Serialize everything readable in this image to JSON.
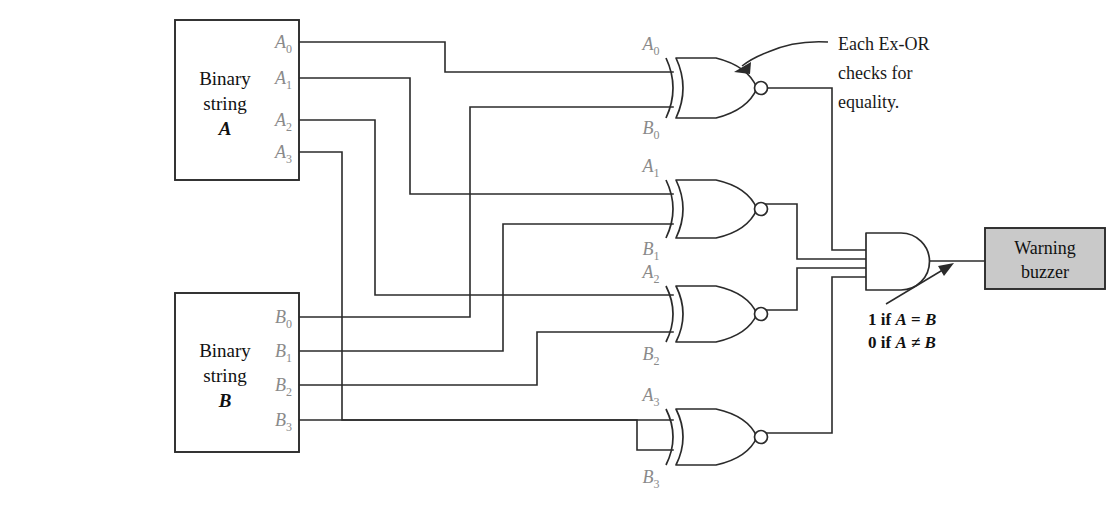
{
  "diagram": {
    "colors": {
      "wire": "#2b2b2b",
      "pin_label": "#8a8a8a",
      "buzzer_fill": "#c9c9c9",
      "text": "#1a1a1a",
      "background": "#ffffff"
    },
    "blocks": {
      "string_a": {
        "line1": "Binary",
        "line2": "string",
        "line3": "A",
        "pins": [
          {
            "base": "A",
            "sub": "0"
          },
          {
            "base": "A",
            "sub": "1"
          },
          {
            "base": "A",
            "sub": "2"
          },
          {
            "base": "A",
            "sub": "3"
          }
        ]
      },
      "string_b": {
        "line1": "Binary",
        "line2": "string",
        "line3": "B",
        "pins": [
          {
            "base": "B",
            "sub": "0"
          },
          {
            "base": "B",
            "sub": "1"
          },
          {
            "base": "B",
            "sub": "2"
          },
          {
            "base": "B",
            "sub": "3"
          }
        ]
      },
      "buzzer": {
        "line1": "Warning",
        "line2": "buzzer"
      }
    },
    "gates": [
      {
        "type": "xnor",
        "input_top": {
          "base": "A",
          "sub": "0"
        },
        "input_bottom": {
          "base": "B",
          "sub": "0"
        }
      },
      {
        "type": "xnor",
        "input_top": {
          "base": "A",
          "sub": "1"
        },
        "input_bottom": {
          "base": "B",
          "sub": "1"
        }
      },
      {
        "type": "xnor",
        "input_top": {
          "base": "A",
          "sub": "2"
        },
        "input_bottom": {
          "base": "B",
          "sub": "2"
        }
      },
      {
        "type": "xnor",
        "input_top": {
          "base": "A",
          "sub": "3"
        },
        "input_bottom": {
          "base": "B",
          "sub": "3"
        }
      }
    ],
    "and_gate": {
      "type": "and",
      "inputs": 4
    },
    "annotations": {
      "exor_note": {
        "line1": "Each Ex-OR",
        "line2": "checks for",
        "line3": "equality."
      },
      "output_note": {
        "line1_prefix": "1 if ",
        "line1_a": "A",
        "line1_op": " = ",
        "line1_b": "B",
        "line2_prefix": "0 if ",
        "line2_a": "A",
        "line2_op": " ≠ ",
        "line2_b": "B"
      }
    }
  }
}
